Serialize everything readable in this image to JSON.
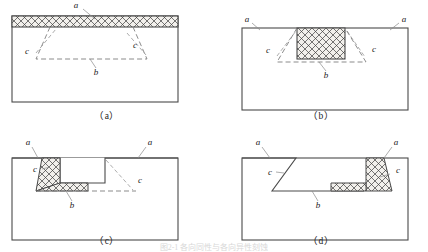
{
  "figure": {
    "caption": "图2-1 各向同性与各向异性刻蚀",
    "panels": [
      {
        "id": "a",
        "caption": "（a）",
        "labels": {
          "a": "a",
          "b": "b",
          "c_left": "c",
          "c_right": "c"
        },
        "description": "Blanket hatched film covering the full substrate top surface with dashed trapezoidal profile beneath"
      },
      {
        "id": "b",
        "caption": "（b）",
        "labels": {
          "a_left": "a",
          "a_right": "a",
          "b": "b",
          "c_left": "c",
          "c_right": "c"
        },
        "description": "Rectangular hatched block centered on substrate top with dashed trapezoid outline"
      },
      {
        "id": "c",
        "caption": "（c）",
        "labels": {
          "a_left": "a",
          "a_right": "a",
          "b": "b",
          "c_left": "c",
          "c_right": "c"
        },
        "description": "Trench cross-section with hatched wedge on left sidewall and hatched strip on trench floor"
      },
      {
        "id": "d",
        "caption": "（d）",
        "labels": {
          "a_left": "a",
          "a_right": "a",
          "b": "b",
          "c_left": "c",
          "c_right": "c"
        },
        "description": "Mirrored trench cross-section with hatched wedge on right sidewall and hatched strip on floor"
      }
    ],
    "colors": {
      "outline": "#4a4a4a",
      "hatch_line": "#3d3d3d",
      "hatch_fill": "#f2f0ec",
      "dashed": "#777777",
      "leader": "#8a8a8a",
      "text": "#1a1a1a"
    }
  }
}
